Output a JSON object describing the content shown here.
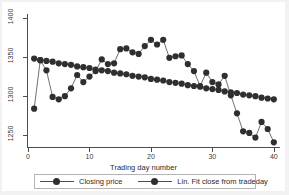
{
  "chart_data": {
    "type": "scatter",
    "title": "",
    "subtitle": "",
    "xlabel": "Trading day number",
    "ylabel": "",
    "xlim": [
      0,
      41
    ],
    "ylim": [
      1235,
      1405
    ],
    "xticks": [
      0,
      10,
      20,
      30,
      40
    ],
    "yticks": [
      1250,
      1300,
      1350,
      1400
    ],
    "xtick_labels": [
      "0",
      "10",
      "20",
      "30",
      "40"
    ],
    "ytick_labels": [
      "1250",
      "1300",
      "1350",
      "1400"
    ],
    "grid": false,
    "legend_position": "bottom",
    "marker": "filled-circle",
    "series_color": "#2f2f2f",
    "line_color": "#4d4d4d",
    "x": [
      1,
      2,
      3,
      4,
      5,
      6,
      7,
      8,
      9,
      10,
      11,
      12,
      13,
      14,
      15,
      16,
      17,
      18,
      19,
      20,
      21,
      22,
      23,
      24,
      25,
      26,
      27,
      28,
      29,
      30,
      31,
      32,
      33,
      34,
      35,
      36,
      37,
      38,
      39,
      40
    ],
    "series": [
      {
        "name": "Closing price",
        "values": [
          1284,
          1346,
          1333,
          1299,
          1296,
          1300,
          1310,
          1327,
          1318,
          1325,
          1332,
          1347,
          1341,
          1342,
          1360,
          1361,
          1356,
          1354,
          1364,
          1372,
          1366,
          1372,
          1349,
          1351,
          1352,
          1341,
          1332,
          1313,
          1330,
          1318,
          1315,
          1326,
          1301,
          1278,
          1255,
          1253,
          1247,
          1267,
          1258,
          1241
        ]
      },
      {
        "name": "Lin. Fit close from tradeday",
        "values": [
          1348,
          1346,
          1345,
          1344,
          1342,
          1341,
          1340,
          1338,
          1337,
          1336,
          1334,
          1333,
          1332,
          1330,
          1329,
          1328,
          1326,
          1325,
          1324,
          1322,
          1321,
          1320,
          1318,
          1317,
          1316,
          1314,
          1313,
          1312,
          1310,
          1309,
          1308,
          1306,
          1305,
          1304,
          1302,
          1301,
          1300,
          1298,
          1297,
          1296
        ]
      }
    ],
    "legend": [
      "Closing price",
      "Lin. Fit close from tradeday"
    ]
  }
}
